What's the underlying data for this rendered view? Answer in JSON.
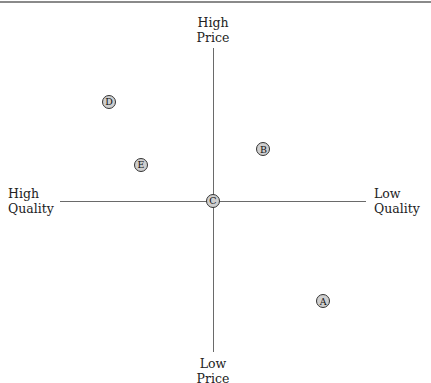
{
  "diagram": {
    "type": "perceptual-map",
    "axes": {
      "top": [
        "High",
        "Price"
      ],
      "bottom": [
        "Low",
        "Price"
      ],
      "left": [
        "High",
        "Quality"
      ],
      "right": [
        "Low",
        "Quality"
      ]
    },
    "points": [
      {
        "label": "A",
        "x": 0.72,
        "y": -0.66
      },
      {
        "label": "B",
        "x": 0.33,
        "y": 0.34
      },
      {
        "label": "C",
        "x": 0.0,
        "y": 0.0
      },
      {
        "label": "D",
        "x": -0.68,
        "y": 0.65
      },
      {
        "label": "E",
        "x": -0.47,
        "y": 0.24
      }
    ]
  },
  "chart_data": {
    "type": "scatter",
    "title": "",
    "xlabel": "Quality (High ← → Low)",
    "ylabel": "Price (Low ← → High)",
    "xlim": [
      -1,
      1
    ],
    "ylim": [
      -1,
      1
    ],
    "grid": false,
    "x_axis_ends": {
      "left": "High Quality",
      "right": "Low Quality"
    },
    "y_axis_ends": {
      "top": "High Price",
      "bottom": "Low Price"
    },
    "series": [
      {
        "name": "Brands",
        "points": [
          {
            "label": "A",
            "x": 0.72,
            "y": -0.66
          },
          {
            "label": "B",
            "x": 0.33,
            "y": 0.34
          },
          {
            "label": "C",
            "x": 0.0,
            "y": 0.0
          },
          {
            "label": "D",
            "x": -0.68,
            "y": 0.65
          },
          {
            "label": "E",
            "x": -0.47,
            "y": 0.24
          }
        ]
      }
    ]
  }
}
